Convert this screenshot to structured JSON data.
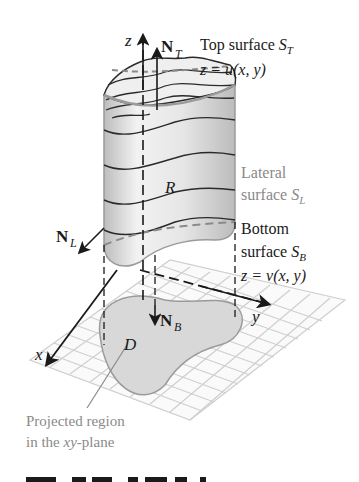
{
  "figure": {
    "labels": {
      "z_axis": "z",
      "x_axis": "x",
      "y_axis": "y",
      "normal_top": "N",
      "normal_top_sub": "T",
      "normal_lateral": "N",
      "normal_lateral_sub": "L",
      "normal_bottom": "N",
      "normal_bottom_sub": "B",
      "region_R": "R",
      "region_D": "D"
    },
    "annotations": {
      "top_line1_prefix": "Top surface ",
      "top_line1_sym": "S",
      "top_line1_sub": "T",
      "top_line2": "z = u(x, y)",
      "lateral_line1": "Lateral",
      "lateral_line2_prefix": "surface ",
      "lateral_line2_sym": "S",
      "lateral_line2_sub": "L",
      "bottom_line1": "Bottom",
      "bottom_line2_prefix": "surface ",
      "bottom_line2_sym": "S",
      "bottom_line2_sub": "B",
      "bottom_line3": "z = v(x, y)",
      "projected_line1": "Projected region",
      "projected_line2_prefix": "in the ",
      "projected_line2_italic": "xy",
      "projected_line2_suffix": "-plane"
    },
    "caption_partial": "Figure 7.13 ..."
  },
  "colors": {
    "black": "#1a1a1a",
    "gray_text": "#8a8a8a",
    "grid": "#c8c8c8",
    "region_fill": "#d9d9d9",
    "solid_fill": "#ececec"
  }
}
